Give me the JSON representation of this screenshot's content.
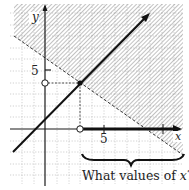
{
  "figure": {
    "axis_labels": {
      "x": "x",
      "y": "y"
    },
    "tick_labels": {
      "x_tick": "5",
      "y_tick": "5"
    },
    "question_text_prefix": "What values of ",
    "question_text_var": "x",
    "question_text_suffix": "?",
    "colors": {
      "ink": "#1a1a1a",
      "grid": "#c8c8c8",
      "hatch": "#8a8a8a",
      "background": "#ffffff"
    }
  }
}
